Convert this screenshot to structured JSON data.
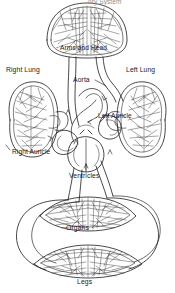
{
  "diagram": {
    "title": "ory System",
    "title_note": "cut-off heading at top edge",
    "style": "hand-drawn black line art on white",
    "width": 175,
    "height": 293,
    "colors": {
      "background": "#ffffff",
      "stroke": "#1a1a1a",
      "mesh_stroke": "#3a3a3a",
      "title_text": "#8d8d8d",
      "label_text": "#1a1a1a"
    },
    "labels": [
      {
        "id": "arms-and-head",
        "text": "Arms and Head",
        "x": 60,
        "y": 44
      },
      {
        "id": "right-lung",
        "text": "Right Lung",
        "x": 6,
        "y": 66
      },
      {
        "id": "left-lung",
        "text": "Left Lung",
        "x": 126,
        "y": 66
      },
      {
        "id": "aorta",
        "text": "Aorta",
        "x": 73,
        "y": 76
      },
      {
        "id": "left-auricle",
        "text": "Left Auricle",
        "x": 98,
        "y": 112
      },
      {
        "id": "right-auricle",
        "text": "Right Auricle",
        "x": 12,
        "y": 148
      },
      {
        "id": "ventricles",
        "text": "Ventricles",
        "x": 69,
        "y": 172
      },
      {
        "id": "organs",
        "text": "Organs",
        "x": 66,
        "y": 224
      },
      {
        "id": "legs",
        "text": "Legs",
        "x": 77,
        "y": 278
      }
    ],
    "parts": [
      {
        "id": "capillary-bed-arms-head",
        "type": "capillary-bed",
        "shape": "oval"
      },
      {
        "id": "right-lung-body",
        "type": "organ",
        "shape": "oval-mesh"
      },
      {
        "id": "left-lung-body",
        "type": "organ",
        "shape": "oval-mesh"
      },
      {
        "id": "heart",
        "type": "organ",
        "shape": "chambered-loops"
      },
      {
        "id": "capillary-bed-organs",
        "type": "capillary-bed",
        "shape": "lens"
      },
      {
        "id": "capillary-bed-legs",
        "type": "capillary-bed",
        "shape": "lens"
      },
      {
        "id": "systemic-loop-left",
        "type": "vessel",
        "shape": "arc"
      },
      {
        "id": "systemic-loop-right",
        "type": "vessel",
        "shape": "arc"
      }
    ]
  }
}
